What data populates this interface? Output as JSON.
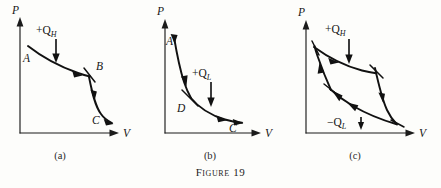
{
  "figure": {
    "caption_label": "Figure",
    "caption_number": "19",
    "caption_full": "Figure 19"
  },
  "panels": [
    {
      "id": "a",
      "sublabel": "(a)",
      "axes": {
        "y_label": "P",
        "x_label": "V"
      },
      "point_labels": [
        "A",
        "B",
        "C"
      ],
      "heat_label": "+Q",
      "heat_subscript": "H",
      "heat_sign": "+",
      "description": "Expansion from A to B along upper isotherm, then adiabatic drop from B to C"
    },
    {
      "id": "b",
      "sublabel": "(b)",
      "axes": {
        "y_label": "P",
        "x_label": "V"
      },
      "point_labels": [
        "A",
        "D",
        "C"
      ],
      "heat_label": "+Q",
      "heat_subscript": "L",
      "heat_sign": "+",
      "description": "Adiabatic path from A through D then isothermal expansion to C"
    },
    {
      "id": "c",
      "sublabel": "(c)",
      "axes": {
        "y_label": "P",
        "x_label": "V"
      },
      "point_labels": [],
      "heat_label_top": "+Q",
      "heat_subscript_top": "H",
      "heat_label_bottom": "−Q",
      "heat_subscript_bottom": "L",
      "description": "Closed Carnot cycle with heat absorbed at high temperature and rejected at low temperature"
    }
  ],
  "colors": {
    "ink": "#111111",
    "axis": "#1b1b1b",
    "page_background": "#fdfdfb"
  }
}
